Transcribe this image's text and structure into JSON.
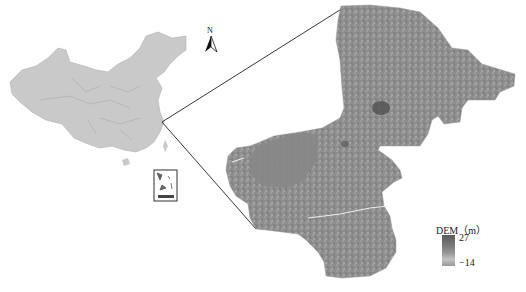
{
  "figure": {
    "type": "location_map",
    "panels": [
      {
        "id": "overview",
        "description": "China overview map with provincial boundaries",
        "fill": "#c8c8c8"
      },
      {
        "id": "detail",
        "description": "Study area DEM raster, grayscale",
        "fill_range": [
          "#5a5a5a",
          "#c4c4c4"
        ]
      }
    ]
  },
  "north_arrow": {
    "label": "N"
  },
  "inset": {
    "description": "South China Sea islands inset"
  },
  "legend": {
    "title": "DEM（m）",
    "max_label": "27",
    "min_label": "−14",
    "colors": {
      "high": "#5a5a5a",
      "mid": "#9a9a9a",
      "low": "#c4c4c4"
    }
  },
  "connector_lines": {
    "color": "#222222"
  }
}
